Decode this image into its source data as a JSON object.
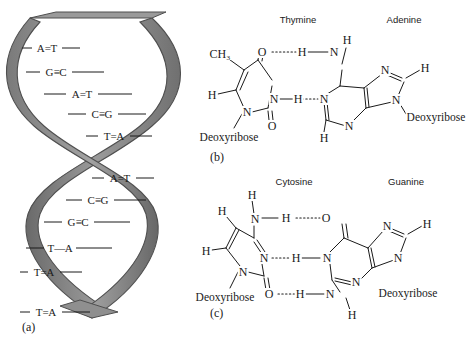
{
  "figure": {
    "panels": {
      "a": "(a)",
      "b": "(b)",
      "c": "(c)"
    }
  },
  "helix": {
    "base_pairs": [
      {
        "left": "A",
        "bond": "=",
        "right": "T"
      },
      {
        "left": "G",
        "bond": "≡",
        "right": "C"
      },
      {
        "left": "A",
        "bond": "=",
        "right": "T"
      },
      {
        "left": "C",
        "bond": "≡",
        "right": "G"
      },
      {
        "left": "T",
        "bond": "=",
        "right": "A"
      },
      {
        "left": "A",
        "bond": "=",
        "right": "T"
      },
      {
        "left": "C",
        "bond": "≡",
        "right": "G"
      },
      {
        "left": "G",
        "bond": "≡",
        "right": "C"
      },
      {
        "left": "T",
        "bond": "—",
        "right": "A"
      },
      {
        "left": "T",
        "bond": "=",
        "right": "A"
      },
      {
        "left": "T",
        "bond": "=",
        "right": "A"
      }
    ],
    "ribbon_color": "#8c8c8c",
    "ribbon_shade_color": "#6e6e6e",
    "ribbon_edge_color": "#4a4a4a"
  },
  "panel_b": {
    "left_base": "Thymine",
    "right_base": "Adenine",
    "atoms": {
      "methyl": "CH₃",
      "t_o_top": "O",
      "t_h_left": "H",
      "t_n_mid": "N",
      "t_n_bottom": "N",
      "t_o_bottom": "O",
      "t_sugar": "Deoxyribose",
      "hb1_h": "H",
      "a_n_amine": "N",
      "a_h_amine_top": "H",
      "hb2_h": "H",
      "a_n1": "N",
      "a_n_imid_top": "N",
      "a_h_imid": "H",
      "a_n9": "N",
      "a_sugar": "Deoxyribose",
      "a_n3": "N",
      "a_h_c2": "H"
    }
  },
  "panel_c": {
    "left_base": "Cytosine",
    "right_base": "Guanine",
    "atoms": {
      "c_h_amine_top": "H",
      "c_n_amine": "N",
      "c_h_ring": "H",
      "c_h_left": "H",
      "c_n_mid": "N",
      "c_n_bottom": "N",
      "c_o_bottom": "O",
      "c_sugar": "Deoxyribose",
      "hb1_h": "H",
      "g_o_top": "O",
      "hb2_h": "H",
      "g_n1": "N",
      "hb3_h": "H",
      "g_n_amine": "N",
      "g_h_amine_bottom": "H",
      "g_n_imid_top": "N",
      "g_h_imid": "H",
      "g_n9": "N",
      "g_n3": "N",
      "g_sugar": "Deoxyribose"
    }
  }
}
